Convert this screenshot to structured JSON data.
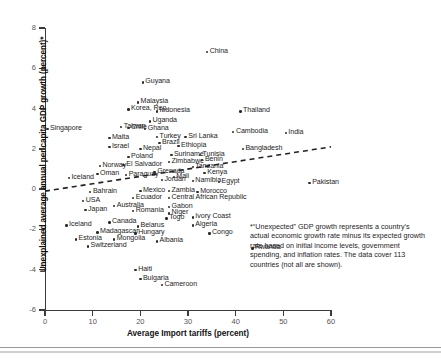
{
  "chart_data": {
    "type": "scatter",
    "title": "",
    "xlabel": "Average Import tariffs (percent)",
    "ylabel": "Unexplained average annual per capita GDP growth (percent)*",
    "xlim": [
      0,
      60
    ],
    "ylim": [
      -6,
      8
    ],
    "xticks": [
      "0",
      "10",
      "20",
      "30",
      "40",
      "50",
      "60"
    ],
    "yticks": [
      "8",
      "6",
      "4",
      "2",
      "0",
      "-2",
      "-4",
      "-6"
    ],
    "grid": false,
    "legend": "none",
    "trendline": {
      "type": "dashed-linear",
      "x0": 0,
      "y0": -0.1,
      "x1": 60,
      "y1": 2.1
    },
    "points": [
      {
        "label": "China",
        "x": 34.0,
        "y": 6.8
      },
      {
        "label": "Guyana",
        "x": 20.5,
        "y": 5.3
      },
      {
        "label": "Malaysia",
        "x": 19.5,
        "y": 4.3
      },
      {
        "label": "Korea, Rep.",
        "x": 17.5,
        "y": 3.95
      },
      {
        "label": "Indonesia",
        "x": 23.5,
        "y": 3.85
      },
      {
        "label": "Thailand",
        "x": 41.0,
        "y": 3.85
      },
      {
        "label": "Uganda",
        "x": 22.0,
        "y": 3.35
      },
      {
        "label": "Taiwan",
        "x": 16.0,
        "y": 3.1
      },
      {
        "label": "Chile",
        "x": 17.5,
        "y": 3.05
      },
      {
        "label": "Ghana",
        "x": 21.0,
        "y": 3.0
      },
      {
        "label": "Singapore",
        "x": 0.5,
        "y": 3.0
      },
      {
        "label": "Cambodia",
        "x": 39.5,
        "y": 2.85
      },
      {
        "label": "India",
        "x": 50.5,
        "y": 2.8
      },
      {
        "label": "Turkey",
        "x": 23.5,
        "y": 2.6
      },
      {
        "label": "Sri Lanka",
        "x": 29.5,
        "y": 2.6
      },
      {
        "label": "Malta",
        "x": 13.5,
        "y": 2.55
      },
      {
        "label": "Brazil",
        "x": 24.0,
        "y": 2.3
      },
      {
        "label": "Israel",
        "x": 13.5,
        "y": 2.1
      },
      {
        "label": "Ethiopia",
        "x": 28.0,
        "y": 2.15
      },
      {
        "label": "Nepal",
        "x": 20.0,
        "y": 2.0
      },
      {
        "label": "Bangladesh",
        "x": 41.5,
        "y": 2.0
      },
      {
        "label": "Tunisia",
        "x": 32.5,
        "y": 1.7
      },
      {
        "label": "Suriname",
        "x": 26.5,
        "y": 1.7
      },
      {
        "label": "Poland",
        "x": 17.5,
        "y": 1.6
      },
      {
        "label": "Benin",
        "x": 33.0,
        "y": 1.45
      },
      {
        "label": "Zimbabwe",
        "x": 26.0,
        "y": 1.35
      },
      {
        "label": "El Salvador",
        "x": 16.5,
        "y": 1.2
      },
      {
        "label": "Norway",
        "x": 11.5,
        "y": 1.15
      },
      {
        "label": "Tanzania",
        "x": 31.0,
        "y": 1.1
      },
      {
        "label": "Grenada",
        "x": 23.0,
        "y": 0.85
      },
      {
        "label": "Kenya",
        "x": 33.5,
        "y": 0.8
      },
      {
        "label": "Oman",
        "x": 11.0,
        "y": 0.75
      },
      {
        "label": "Paraguay",
        "x": 17.0,
        "y": 0.7
      },
      {
        "label": "Mali",
        "x": 27.0,
        "y": 0.6
      },
      {
        "label": "Iceland",
        "x": 5.0,
        "y": 0.55
      },
      {
        "label": "Jordan",
        "x": 24.5,
        "y": 0.45
      },
      {
        "label": "Namibia",
        "x": 31.0,
        "y": 0.4
      },
      {
        "label": "Egypt",
        "x": 36.5,
        "y": 0.35
      },
      {
        "label": "Pakistan",
        "x": 55.5,
        "y": 0.3
      },
      {
        "label": "Bahrain",
        "x": 9.5,
        "y": -0.15
      },
      {
        "label": "Mexico",
        "x": 20.0,
        "y": -0.1
      },
      {
        "label": "Zambia",
        "x": 26.0,
        "y": -0.1
      },
      {
        "label": "Morocco",
        "x": 32.0,
        "y": -0.15
      },
      {
        "label": "Ecuador",
        "x": 18.5,
        "y": -0.45
      },
      {
        "label": "Central African Republic",
        "x": 26.0,
        "y": -0.45
      },
      {
        "label": "USA",
        "x": 8.0,
        "y": -0.6
      },
      {
        "label": "Australia",
        "x": 14.5,
        "y": -0.85
      },
      {
        "label": "Gabon",
        "x": 26.0,
        "y": -0.9
      },
      {
        "label": "Japan",
        "x": 8.5,
        "y": -1.05
      },
      {
        "label": "Romania",
        "x": 18.5,
        "y": -1.1
      },
      {
        "label": "Niger",
        "x": 26.0,
        "y": -1.2
      },
      {
        "label": "Togo",
        "x": 25.5,
        "y": -1.45
      },
      {
        "label": "Ivory Coast",
        "x": 31.0,
        "y": -1.4
      },
      {
        "label": "Canada",
        "x": 13.5,
        "y": -1.65
      },
      {
        "label": "Iceland",
        "x": 4.5,
        "y": -1.8
      },
      {
        "label": "Belarus",
        "x": 19.5,
        "y": -1.85
      },
      {
        "label": "Algeria",
        "x": 31.0,
        "y": -1.8
      },
      {
        "label": "Madagascar",
        "x": 11.0,
        "y": -2.15
      },
      {
        "label": "Hungary",
        "x": 19.0,
        "y": -2.2
      },
      {
        "label": "Congo",
        "x": 34.5,
        "y": -2.2
      },
      {
        "label": "Estonia",
        "x": 6.5,
        "y": -2.5
      },
      {
        "label": "Mongolia",
        "x": 14.5,
        "y": -2.5
      },
      {
        "label": "Albania",
        "x": 23.5,
        "y": -2.6
      },
      {
        "label": "Switzerland",
        "x": 9.0,
        "y": -2.85
      },
      {
        "label": "Rwanda",
        "x": 43.5,
        "y": -2.95
      },
      {
        "label": "Haiti",
        "x": 19.0,
        "y": -4.0
      },
      {
        "label": "Bulgaria",
        "x": 20.0,
        "y": -4.45
      },
      {
        "label": "Cameroon",
        "x": 24.5,
        "y": -4.75
      }
    ]
  },
  "annotation": {
    "text": "*“Unexpected” GDP growth represents a country’s actual economic growth rate minus its expected growth rate based on initial income levels, government spending, and inflation rates. The data cover 113 countries (not all are shown)."
  }
}
